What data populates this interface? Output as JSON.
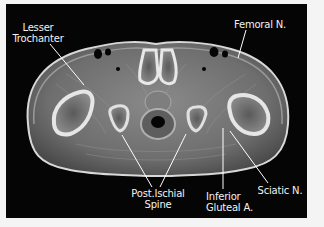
{
  "figure": {
    "type": "axial MRI pelvis at lesser trochanter level",
    "labels": {
      "lesser_trochanter": [
        "Lesser",
        "Trochanter"
      ],
      "femoral_n": [
        "Femoral N."
      ],
      "post_ischial_spine": [
        "Post.Ischial",
        "Spine"
      ],
      "inferior_gluteal_a": [
        "Inferior",
        "Gluteal A."
      ],
      "sciatic_n": [
        "Sciatic N."
      ]
    },
    "colors": {
      "background": "#050505",
      "page": "#f4f4f4",
      "label_text": "#f2f2f2",
      "leader_line": "#ffffff"
    }
  }
}
